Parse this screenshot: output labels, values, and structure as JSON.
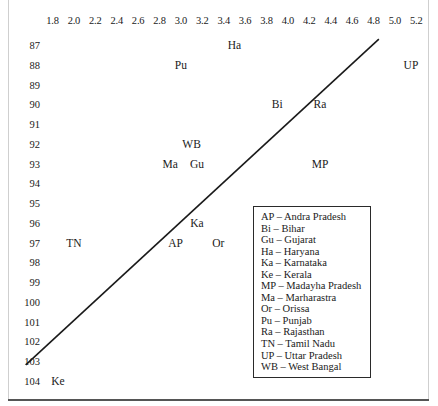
{
  "chart_data": {
    "type": "scatter",
    "title": "",
    "xlabel": "",
    "ylabel": "",
    "xlim": [
      1.7,
      5.3
    ],
    "ylim": [
      86.5,
      104.5
    ],
    "grid": false,
    "xticks": [
      "1.8",
      "2.0",
      "2.2",
      "2.4",
      "2.6",
      "2.8",
      "3.0",
      "3.2",
      "3.4",
      "3.6",
      "3.8",
      "4.0",
      "4.2",
      "4.4",
      "4.6",
      "4.8",
      "5.0",
      "5.2"
    ],
    "yticks": [
      "87",
      "88",
      "89",
      "90",
      "91",
      "92",
      "93",
      "94",
      "95",
      "96",
      "97",
      "98",
      "99",
      "100",
      "101",
      "102",
      "103",
      "104"
    ],
    "points": [
      {
        "label": "Ha",
        "x": 3.5,
        "y": 87.0
      },
      {
        "label": "Pu",
        "x": 3.0,
        "y": 88.0
      },
      {
        "label": "UP",
        "x": 5.15,
        "y": 88.0
      },
      {
        "label": "Bi",
        "x": 3.9,
        "y": 90.0
      },
      {
        "label": "Ra",
        "x": 4.3,
        "y": 90.0
      },
      {
        "label": "WB",
        "x": 3.1,
        "y": 92.0
      },
      {
        "label": "Ma",
        "x": 2.9,
        "y": 93.0
      },
      {
        "label": "Gu",
        "x": 3.15,
        "y": 93.0
      },
      {
        "label": "MP",
        "x": 4.3,
        "y": 93.0
      },
      {
        "label": "Ka",
        "x": 3.15,
        "y": 96.0
      },
      {
        "label": "TN",
        "x": 2.0,
        "y": 97.0
      },
      {
        "label": "AP",
        "x": 2.95,
        "y": 97.0
      },
      {
        "label": "Or",
        "x": 3.35,
        "y": 97.0
      },
      {
        "label": "Ke",
        "x": 1.85,
        "y": 104.0
      }
    ],
    "trendline": {
      "x_start": 1.55,
      "y_start": 103.2,
      "x_end": 4.85,
      "y_end": 86.7,
      "color": "#1a1a1a",
      "width": 1.6
    },
    "legend": {
      "position": "inside-right",
      "entries": [
        "AP – Andra Pradesh",
        "Bi – Bihar",
        "Gu – Gujarat",
        "Ha – Haryana",
        "Ka – Karnataka",
        "Ke – Kerala",
        "MP – Madayha Pradesh",
        "Ma – Marharastra",
        "Or – Orissa",
        "Pu – Punjab",
        "Ra – Rajasthan",
        "TN – Tamil Nadu",
        "UP – Uttar Pradesh",
        "WB – West Bangal"
      ]
    }
  }
}
